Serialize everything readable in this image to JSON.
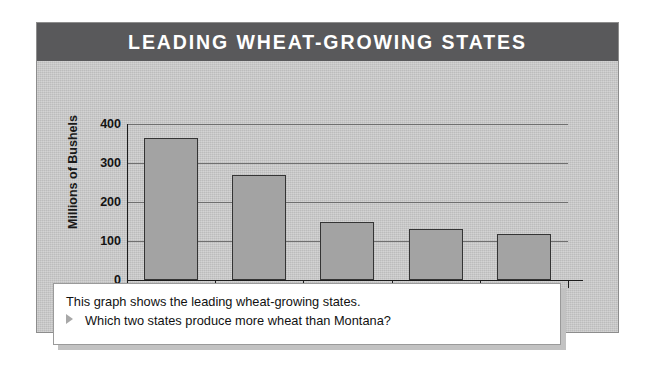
{
  "figure": {
    "title": "LEADING WHEAT-GROWING STATES",
    "panel_color": "#c9c9c9",
    "title_bar_color": "#59595b",
    "bar_color": "#a3a3a3",
    "bar_border_color": "#343434"
  },
  "chart_data": {
    "type": "bar",
    "title": "LEADING WHEAT-GROWING STATES",
    "xlabel": "",
    "ylabel": "Millions of Bushels",
    "categories": [
      "Kansas",
      "North Dakota",
      "Montana",
      "Oklahoma",
      "Washington"
    ],
    "values": [
      365,
      270,
      148,
      132,
      117
    ],
    "ylim": [
      0,
      400
    ],
    "yticks": [
      0,
      100,
      200,
      300,
      400
    ],
    "ytick_labels": [
      "0",
      "100",
      "200",
      "300",
      "400"
    ],
    "grid": true,
    "legend": false
  },
  "caption": {
    "line1": "This graph shows the leading wheat-growing states.",
    "line2": "Which two states produce more wheat than Montana?",
    "bullet": "triangle-right"
  }
}
